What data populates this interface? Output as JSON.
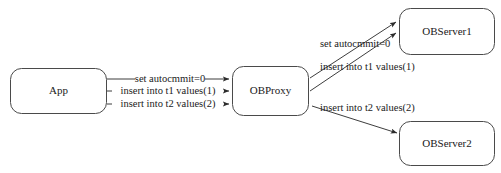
{
  "diagram": {
    "type": "flow-diagram",
    "background_color": "#ffffff",
    "stroke_color": "#3d3d3d",
    "text_color": "#1a1a1a",
    "nodes": [
      {
        "id": "app",
        "label": "App"
      },
      {
        "id": "obproxy",
        "label": "OBProxy"
      },
      {
        "id": "observer1",
        "label": "OBServer1"
      },
      {
        "id": "observer2",
        "label": "OBServer2"
      }
    ],
    "edges": [
      {
        "id": "app-to-proxy-1",
        "from": "App",
        "to": "OBProxy",
        "label": "set autocmmit=0"
      },
      {
        "id": "app-to-proxy-2",
        "from": "App",
        "to": "OBProxy",
        "label": "insert into t1 values(1)"
      },
      {
        "id": "app-to-proxy-3",
        "from": "App",
        "to": "OBProxy",
        "label": "insert into t2 values(2)"
      },
      {
        "id": "proxy-to-server1-1",
        "from": "OBProxy",
        "to": "OBServer1",
        "label": "set autocmmit=0"
      },
      {
        "id": "proxy-to-server1-2",
        "from": "OBProxy",
        "to": "OBServer1",
        "label": "insert into t1 values(1)"
      },
      {
        "id": "proxy-to-server2-1",
        "from": "OBProxy",
        "to": "OBServer2",
        "label": "insert into t2 values(2)"
      }
    ]
  }
}
